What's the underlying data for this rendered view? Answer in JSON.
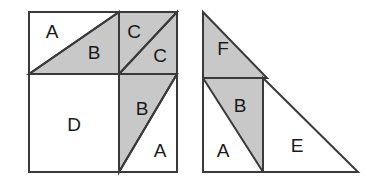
{
  "figure": {
    "canvas": {
      "width": 373,
      "height": 181
    },
    "colors": {
      "background": "#ffffff",
      "fill_shaded": "#c8c8c8",
      "fill_plain": "#ffffff",
      "stroke": "#3a3a3a",
      "label_text": "#1a1a1a"
    },
    "stroke_width": 2
  },
  "left_square": {
    "name": "square-figure",
    "bounds": {
      "x": 29,
      "y": 12,
      "width": 148,
      "height": 160
    },
    "dividers": {
      "vertical_x": 119,
      "horizontal_y": 74
    },
    "pieces": [
      {
        "id": "left-A-top",
        "label": "A",
        "shaded": false,
        "cx": 52,
        "cy": 33,
        "points": "29,12 119,12 29,74"
      },
      {
        "id": "left-B-top",
        "label": "B",
        "shaded": true,
        "cx": 94,
        "cy": 54,
        "points": "119,12 119,74 29,74"
      },
      {
        "id": "left-C-upper",
        "label": "C",
        "shaded": true,
        "cx": 134,
        "cy": 33,
        "points": "119,12 177,12 119,74"
      },
      {
        "id": "left-C-lower",
        "label": "C",
        "shaded": true,
        "cx": 160,
        "cy": 57,
        "points": "177,12 177,74 119,74"
      },
      {
        "id": "left-D",
        "label": "D",
        "shaded": false,
        "cx": 74,
        "cy": 126,
        "points": "29,74 119,74 119,172 29,172"
      },
      {
        "id": "left-B-bottom",
        "label": "B",
        "shaded": true,
        "cx": 142,
        "cy": 110,
        "points": "119,74 177,74 119,172"
      },
      {
        "id": "left-A-bottom",
        "label": "A",
        "shaded": false,
        "cx": 160,
        "cy": 152,
        "points": "177,74 177,172 119,172"
      }
    ]
  },
  "right_triangle": {
    "name": "triangle-figure",
    "vertices": {
      "top": [
        203,
        12
      ],
      "bottom_left": [
        203,
        172
      ],
      "bottom_right": [
        358,
        172
      ]
    },
    "dividers": {
      "horizontal_y": 78,
      "vertical_x": 263
    },
    "pieces": [
      {
        "id": "right-F",
        "label": "F",
        "shaded": true,
        "cx": 223,
        "cy": 50,
        "points": "203,12 267,78 203,78"
      },
      {
        "id": "right-B",
        "label": "B",
        "shaded": true,
        "cx": 240,
        "cy": 107,
        "points": "203,78 263,78 263,172 203,172"
      },
      {
        "id": "right-A",
        "label": "A",
        "shaded": false,
        "cx": 223,
        "cy": 152,
        "points": "203,78 263,172 203,172"
      },
      {
        "id": "right-E",
        "label": "E",
        "shaded": false,
        "cx": 297,
        "cy": 147,
        "points": "263,78 358,172 263,172"
      }
    ]
  },
  "piece_legend": {
    "A": "A",
    "B": "B",
    "C": "C",
    "D": "D",
    "E": "E",
    "F": "F"
  }
}
